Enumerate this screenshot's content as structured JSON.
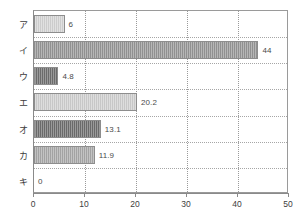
{
  "chart_data": {
    "type": "bar",
    "orientation": "horizontal",
    "title": "",
    "subtitle": "",
    "xlabel": "",
    "ylabel": "",
    "xlim": [
      0,
      50
    ],
    "xticks": [
      0,
      10,
      20,
      30,
      40,
      50
    ],
    "grid": "dotted vertical gridlines at 10,20,30,40 and dotted horizontal separators between categories",
    "legend": "none",
    "categories": [
      "ア",
      "イ",
      "ウ",
      "エ",
      "オ",
      "カ",
      "キ"
    ],
    "values": [
      6,
      44,
      4.8,
      20.2,
      13.1,
      11.9,
      0
    ],
    "value_labels": [
      "6",
      "44",
      "4.8",
      "20.2",
      "13.1",
      "11.9",
      "0"
    ],
    "bar_colors": [
      "#d4d4d4",
      "#969696",
      "#6f6f6f",
      "#cfcfcf",
      "#6e6e6e",
      "#a9a9a9",
      "#ffffff"
    ],
    "bar_border_color": "#8d8d8d",
    "axis_color": "#8a8a8a",
    "grid_color": "#9a9a9a",
    "text_color": "#3d3d3d",
    "background": "#ffffff"
  }
}
